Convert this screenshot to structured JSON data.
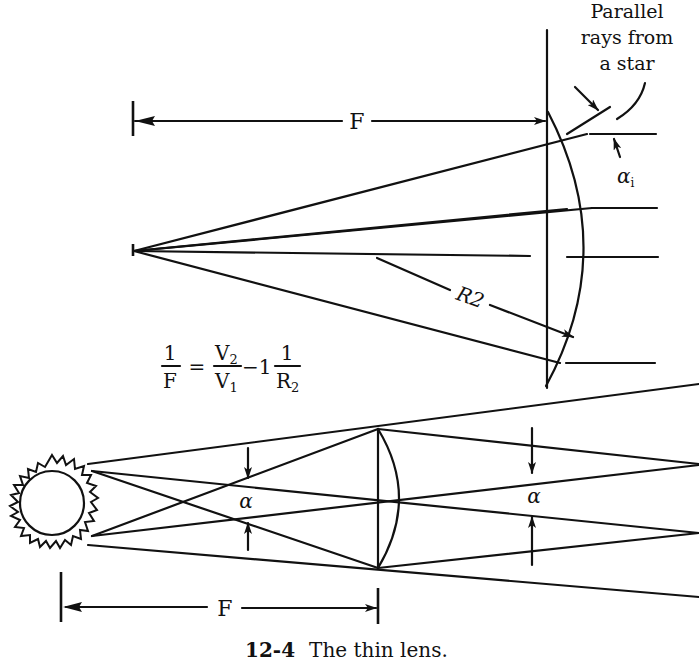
{
  "figure": {
    "caption_number": "12-4",
    "caption_text": "The thin lens."
  },
  "top_diagram": {
    "annotation_line1": "Parallel",
    "annotation_line2": "rays from",
    "annotation_line3": "a star",
    "focal_label": "F",
    "incidence_label": "α",
    "incidence_subscript": "i",
    "radius_label": "R2"
  },
  "equation": {
    "lhs_num": "1",
    "lhs_den": "F",
    "equals": "=",
    "v_num": "V",
    "v_num_sub": "2",
    "v_den": "V",
    "v_den_sub": "1",
    "minus_one": "−1",
    "r_num": "1",
    "r_den": "R",
    "r_den_sub": "2"
  },
  "bottom_diagram": {
    "angle_label_left": "α",
    "angle_label_right": "α",
    "focal_label": "F"
  }
}
